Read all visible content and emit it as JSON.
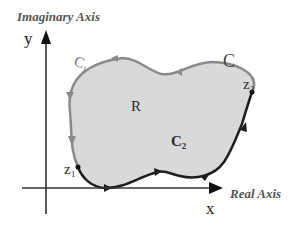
{
  "diagram": {
    "labels": {
      "y_axis_title": "Imaginary Axis",
      "x_axis_title": "Real Axis",
      "y_var": "y",
      "x_var": "x",
      "region": "R",
      "contour": "C",
      "c1": "C₁",
      "c2": "C₂",
      "z1": "z₁",
      "z2": "z₂"
    },
    "colors": {
      "background": "#ffffff",
      "region_fill": "#d9d9d9",
      "c1_stroke": "#8a8a8a",
      "c2_stroke": "#1e1e1e",
      "axis": "#333333"
    }
  }
}
